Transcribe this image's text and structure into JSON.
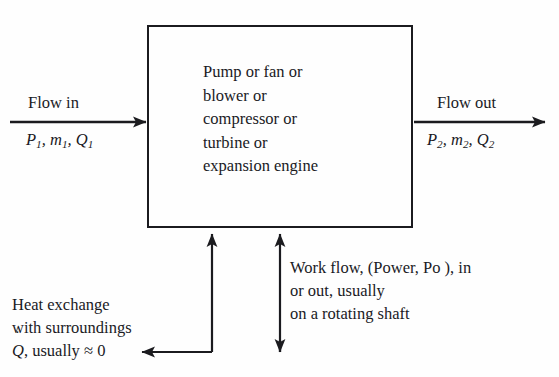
{
  "diagram": {
    "type": "block-flow-diagram",
    "background_color": "#fefefe",
    "line_color": "#1b1b1f",
    "text_color": "#1a1a1e"
  },
  "device_box": {
    "name": "control-volume",
    "lines": [
      "Pump or fan or",
      "blower or",
      "compressor or",
      "turbine or",
      "expansion engine"
    ]
  },
  "inlet": {
    "label": "Flow in",
    "variables": {
      "pressure": "P",
      "pressure_sub": "1",
      "mass_flow": "m",
      "mass_flow_sub": "1",
      "volume_flow": "Q",
      "volume_flow_sub": "1",
      "separator": ", "
    },
    "arrow_direction": "right"
  },
  "outlet": {
    "label": "Flow out",
    "variables": {
      "pressure": "P",
      "pressure_sub": "2",
      "mass_flow": "m",
      "mass_flow_sub": "2",
      "volume_flow": "Q",
      "volume_flow_sub": "2",
      "separator": ", "
    },
    "arrow_direction": "right"
  },
  "heat_exchange": {
    "line1": "Heat exchange",
    "line2": "with surroundings",
    "symbol": "Q",
    "line3_tail": ", usually ≈ 0",
    "arrow_direction": "left"
  },
  "work_flow": {
    "line1": "Work flow, (Power, Po ), in",
    "line2": "or out, usually",
    "line3": "on a rotating shaft",
    "arrow_direction": "bidirectional-vertical"
  }
}
